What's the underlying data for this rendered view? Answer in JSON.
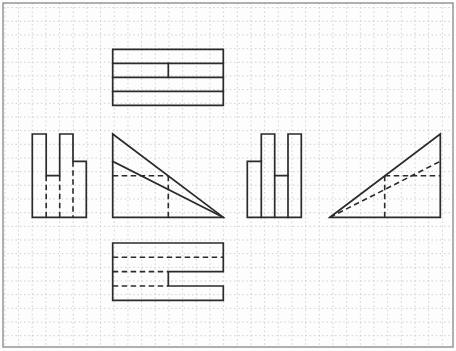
{
  "canvas": {
    "width": 456,
    "height": 351,
    "paper_color": "#fdfdfd",
    "border_color": "#8f8f8f",
    "border_rect": {
      "x": 3,
      "y": 3,
      "w": 450,
      "h": 344
    },
    "grid": {
      "pitch": 13.67,
      "offset_x": 4.9,
      "offset_y": 7.6,
      "color": "#d2d2d2"
    }
  },
  "drawing": {
    "stroke_color": "#2b2b2b",
    "views": [
      {
        "name": "top-view",
        "outline": [
          [
            112.7,
            49.3
          ],
          [
            223.3,
            49.3
          ],
          [
            223.3,
            105.3
          ],
          [
            112.7,
            105.3
          ]
        ],
        "solid": [
          [
            [
              112.7,
              63.3
            ],
            [
              223.3,
              63.3
            ]
          ],
          [
            [
              112.7,
              77.3
            ],
            [
              223.3,
              77.3
            ]
          ],
          [
            [
              112.7,
              91.3
            ],
            [
              223.3,
              91.3
            ]
          ],
          [
            [
              168.3,
              63.3
            ],
            [
              168.3,
              77.3
            ]
          ]
        ],
        "dashed": []
      },
      {
        "name": "left-side-view",
        "outline": [
          [
            32.3,
            134
          ],
          [
            46.2,
            134
          ],
          [
            46.2,
            175.7
          ],
          [
            59.7,
            175.7
          ],
          [
            59.7,
            134
          ],
          [
            73,
            134
          ],
          [
            73,
            161.3
          ],
          [
            86.3,
            161.3
          ],
          [
            86.3,
            217.3
          ],
          [
            32.3,
            217.3
          ]
        ],
        "solid": [],
        "dashed": [
          [
            [
              46.2,
              175.7
            ],
            [
              46.2,
              217.3
            ]
          ],
          [
            [
              59.7,
              175.7
            ],
            [
              59.7,
              217.3
            ]
          ],
          [
            [
              73,
              161.3
            ],
            [
              73,
              217.3
            ]
          ]
        ]
      },
      {
        "name": "front-view",
        "outline": [
          [
            112.7,
            134
          ],
          [
            223.3,
            217.3
          ],
          [
            112.7,
            217.3
          ]
        ],
        "solid": [
          [
            [
              112.7,
              161.3
            ],
            [
              223.3,
              217.3
            ]
          ]
        ],
        "dashed": [
          [
            [
              112.7,
              175.7
            ],
            [
              168.3,
              175.7
            ]
          ],
          [
            [
              168.3,
              175.7
            ],
            [
              168.3,
              217.3
            ]
          ]
        ]
      },
      {
        "name": "right-side-view",
        "outline": [
          [
            247.3,
            161.3
          ],
          [
            261.3,
            161.3
          ],
          [
            261.3,
            134
          ],
          [
            274.7,
            134
          ],
          [
            274.7,
            175.7
          ],
          [
            288,
            175.7
          ],
          [
            288,
            134
          ],
          [
            301.3,
            134
          ],
          [
            301.3,
            217.3
          ],
          [
            247.3,
            217.3
          ]
        ],
        "solid": [
          [
            [
              261.3,
              161.3
            ],
            [
              261.3,
              217.3
            ]
          ],
          [
            [
              274.7,
              175.7
            ],
            [
              274.7,
              217.3
            ]
          ],
          [
            [
              288,
              175.7
            ],
            [
              288,
              217.3
            ]
          ]
        ],
        "dashed": []
      },
      {
        "name": "auxiliary-right-view",
        "outline": [
          [
            330,
            217.3
          ],
          [
            440.3,
            134
          ],
          [
            440.3,
            217.3
          ]
        ],
        "solid": [],
        "dashed": [
          [
            [
              330,
              217.3
            ],
            [
              440.3,
              161.3
            ]
          ],
          [
            [
              384.7,
              175.7
            ],
            [
              440.3,
              175.7
            ]
          ],
          [
            [
              384.7,
              175.7
            ],
            [
              384.7,
              217.3
            ]
          ]
        ]
      },
      {
        "name": "bottom-view",
        "outline": [
          [
            112.7,
            243
          ],
          [
            223.3,
            243
          ],
          [
            223.3,
            271.6
          ],
          [
            168.3,
            271.6
          ],
          [
            168.3,
            286
          ],
          [
            223.3,
            286
          ],
          [
            223.3,
            300.3
          ],
          [
            112.7,
            300.3
          ]
        ],
        "solid": [],
        "dashed": [
          [
            [
              112.7,
              257.3
            ],
            [
              223.3,
              257.3
            ]
          ],
          [
            [
              112.7,
              271.6
            ],
            [
              168.3,
              271.6
            ]
          ],
          [
            [
              112.7,
              286
            ],
            [
              168.3,
              286
            ]
          ]
        ]
      }
    ]
  }
}
